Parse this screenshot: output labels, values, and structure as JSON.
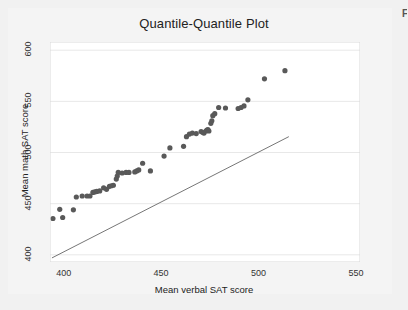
{
  "figure": {
    "background_color": "#f1f1f1",
    "plot_background_color": "#ffffff",
    "corner_mark": "F"
  },
  "chart_data": {
    "type": "scatter",
    "title": "Quantile-Quantile Plot",
    "xlabel": "Mean verbal SAT score",
    "ylabel": "Mean math SAT score",
    "xlim": [
      393,
      552
    ],
    "ylim": [
      393,
      608
    ],
    "xticks": [
      400,
      450,
      500,
      550
    ],
    "yticks": [
      400,
      450,
      500,
      550,
      600
    ],
    "grid": true,
    "grid_color": "#e8e8e8",
    "legend": null,
    "marker_color": "#595959",
    "marker_size": 2.6,
    "series": [
      {
        "name": "Quantile pairs",
        "type": "scatter",
        "points": [
          [
            394.5,
            435.5
          ],
          [
            398.0,
            444.5
          ],
          [
            399.5,
            436.5
          ],
          [
            405.0,
            444.0
          ],
          [
            406.5,
            456.5
          ],
          [
            409.5,
            457.5
          ],
          [
            412.0,
            457.5
          ],
          [
            413.5,
            457.5
          ],
          [
            415.0,
            461.0
          ],
          [
            416.0,
            461.5
          ],
          [
            417.0,
            462.0
          ],
          [
            418.5,
            462.5
          ],
          [
            420.5,
            465.5
          ],
          [
            422.0,
            464.0
          ],
          [
            423.5,
            467.0
          ],
          [
            424.5,
            467.5
          ],
          [
            425.5,
            468.0
          ],
          [
            427.0,
            474.0
          ],
          [
            427.5,
            477.0
          ],
          [
            428.0,
            480.5
          ],
          [
            430.0,
            480.0
          ],
          [
            432.0,
            480.5
          ],
          [
            433.5,
            480.5
          ],
          [
            436.5,
            481.0
          ],
          [
            437.5,
            482.0
          ],
          [
            438.5,
            483.0
          ],
          [
            440.5,
            489.5
          ],
          [
            444.5,
            482.0
          ],
          [
            451.5,
            496.5
          ],
          [
            454.5,
            504.5
          ],
          [
            461.5,
            506.0
          ],
          [
            463.0,
            515.5
          ],
          [
            464.5,
            518.0
          ],
          [
            466.0,
            519.0
          ],
          [
            468.0,
            518.5
          ],
          [
            470.5,
            520.5
          ],
          [
            471.5,
            519.5
          ],
          [
            472.0,
            519.0
          ],
          [
            473.0,
            521.0
          ],
          [
            473.5,
            522.0
          ],
          [
            474.0,
            522.5
          ],
          [
            474.5,
            521.0
          ],
          [
            475.5,
            528.5
          ],
          [
            476.0,
            531.0
          ],
          [
            476.5,
            536.0
          ],
          [
            477.5,
            538.0
          ],
          [
            479.5,
            544.0
          ],
          [
            483.0,
            543.5
          ],
          [
            489.5,
            543.0
          ],
          [
            491.0,
            544.0
          ],
          [
            492.5,
            545.5
          ],
          [
            494.5,
            551.5
          ],
          [
            503.0,
            572.0
          ],
          [
            513.5,
            580.0
          ]
        ]
      },
      {
        "name": "Reference line",
        "type": "line",
        "color": "#666666",
        "points": [
          [
            394.0,
            397.0
          ],
          [
            515.5,
            515.5
          ]
        ]
      }
    ]
  }
}
